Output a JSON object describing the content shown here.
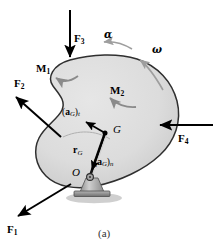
{
  "figure": {
    "caption": "(a)",
    "colors": {
      "body_fill": "#dcdcdc",
      "body_stroke": "#2b2b2b",
      "force_arrow": "#000000",
      "moment_arrow": "#8a8a8a",
      "kinematic_arrow": "#9a9a9a",
      "support_fill": "#b9b9b9",
      "background": "#ffffff"
    }
  },
  "forces": [
    {
      "id": "F1",
      "label": "F",
      "subscript": "1",
      "direction": "down-left",
      "tail": [
        72,
        185
      ],
      "head": [
        15,
        218
      ],
      "label_pos": [
        8,
        228
      ]
    },
    {
      "id": "F2",
      "label": "F",
      "subscript": "2",
      "direction": "up-left",
      "tail": [
        60,
        135
      ],
      "head": [
        13,
        95
      ],
      "label_pos": [
        14,
        83
      ]
    },
    {
      "id": "F3",
      "label": "F",
      "subscript": "3",
      "direction": "down",
      "tail": [
        70,
        10
      ],
      "head": [
        70,
        61
      ],
      "label_pos": [
        74,
        38
      ]
    },
    {
      "id": "F4",
      "label": "F",
      "subscript": "4",
      "direction": "left",
      "tail": [
        213,
        125
      ],
      "head": [
        157,
        125
      ],
      "label_pos": [
        178,
        138
      ]
    }
  ],
  "moments": [
    {
      "id": "M1",
      "label": "M",
      "subscript": "1",
      "label_pos": [
        36,
        68
      ],
      "sense": "counterclockwise-arc-arrowhead-left"
    },
    {
      "id": "M2",
      "label": "M",
      "subscript": "2",
      "label_pos": [
        110,
        86
      ],
      "sense": "counterclockwise-arc-arrowhead-left"
    }
  ],
  "kinematics": [
    {
      "id": "alpha",
      "label": "α",
      "label_pos": [
        106,
        34
      ],
      "note": "angular acceleration, curved arrow outside body, arrowhead pointing left"
    },
    {
      "id": "omega",
      "label": "ω",
      "label_pos": [
        152,
        48
      ],
      "note": "angular velocity, curved arrow outside body, arrowhead pointing up-left"
    }
  ],
  "points": [
    {
      "id": "G",
      "label": "G",
      "label_pos": [
        113,
        126
      ],
      "coord": [
        105,
        133
      ]
    },
    {
      "id": "O",
      "label": "O",
      "label_pos": [
        73,
        170
      ],
      "coord": [
        90,
        176
      ]
    }
  ],
  "vectors": [
    {
      "id": "aG_t",
      "label_prefix": "(",
      "label_bold": "a",
      "label_sub": "G",
      "label_mid": ")",
      "label_suffix": "t",
      "label_pos": [
        66,
        113
      ],
      "tail": [
        105,
        133
      ],
      "head": [
        85,
        121
      ],
      "note": "tangential acceleration of G"
    },
    {
      "id": "aG_n",
      "label_prefix": "(",
      "label_bold": "a",
      "label_sub": "G",
      "label_mid": ")",
      "label_suffix": "n",
      "label_pos": [
        98,
        165
      ],
      "tail": [
        105,
        133
      ],
      "head": [
        91,
        173
      ],
      "note": "normal acceleration of G, directed from G toward O"
    },
    {
      "id": "rG",
      "label_bold": "r",
      "label_sub": "G",
      "label_pos": [
        75,
        150
      ],
      "tail": [
        90,
        176
      ],
      "head": [
        105,
        133
      ],
      "note": "position vector from O to G"
    }
  ],
  "support": {
    "type": "pin-support",
    "pin_pos": [
      90,
      177
    ],
    "label": "pin-at-O"
  }
}
